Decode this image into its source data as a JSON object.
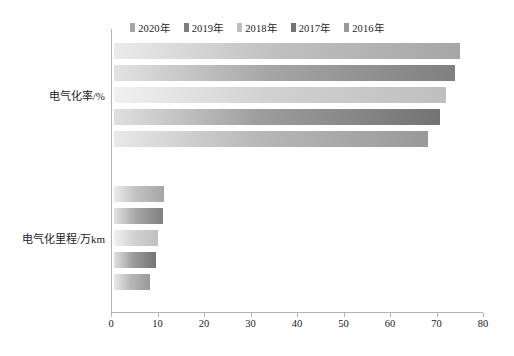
{
  "chart_data": {
    "type": "bar",
    "orientation": "horizontal",
    "title": "",
    "xlabel": "",
    "ylabel": "",
    "xlim": [
      0,
      80
    ],
    "xticks": [
      0,
      10,
      20,
      30,
      40,
      50,
      60,
      70,
      80
    ],
    "grid": false,
    "legend_position": "top-center",
    "categories": [
      "电气化率/%",
      "电气化里程/万km"
    ],
    "series": [
      {
        "name": "2020年",
        "color": "#a6a6a6",
        "values": [
          74.4,
          10.8
        ]
      },
      {
        "name": "2019年",
        "color": "#808080",
        "values": [
          73.3,
          10.5
        ]
      },
      {
        "name": "2018年",
        "color": "#bfbfbf",
        "values": [
          71.4,
          9.5
        ]
      },
      {
        "name": "2017年",
        "color": "#737373",
        "values": [
          70.1,
          9.0
        ]
      },
      {
        "name": "2016年",
        "color": "#999999",
        "values": [
          67.5,
          7.7
        ]
      }
    ]
  },
  "legend": {
    "entries": [
      {
        "label": "2020年"
      },
      {
        "label": "2019年"
      },
      {
        "label": "2018年"
      },
      {
        "label": "2017年"
      },
      {
        "label": "2016年"
      }
    ]
  },
  "axis": {
    "x": {
      "ticks": [
        {
          "label": "0"
        },
        {
          "label": "10"
        },
        {
          "label": "20"
        },
        {
          "label": "30"
        },
        {
          "label": "40"
        },
        {
          "label": "50"
        },
        {
          "label": "60"
        },
        {
          "label": "70"
        },
        {
          "label": "80"
        }
      ]
    },
    "y": {
      "categories": [
        {
          "label": "电气化率/%"
        },
        {
          "label": "电气化里程/万km"
        }
      ]
    }
  }
}
